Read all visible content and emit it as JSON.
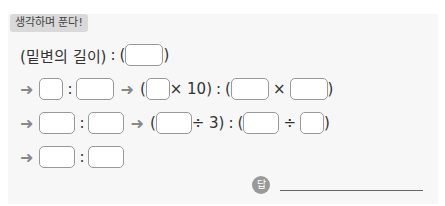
{
  "tag": "생각하며 푼다!",
  "row1": {
    "label": "(밑변의 길이)",
    "colon": ":",
    "open": "(",
    "close": ")"
  },
  "arrow": "➜",
  "colon": ":",
  "row2": {
    "op1": "× 10)",
    "open": "(",
    "open2": "(",
    "times": "×",
    "close": ")"
  },
  "row3": {
    "op1": "÷ 3)",
    "open": "(",
    "open2": "(",
    "div": "÷",
    "close": ")"
  },
  "answer_label": "답"
}
